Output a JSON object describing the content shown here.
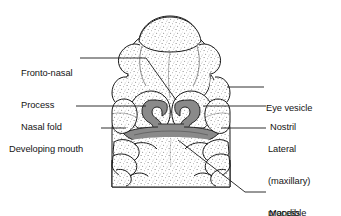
{
  "figure": {
    "type": "anatomical-line-diagram",
    "background_color": "#ffffff",
    "ink_color": "#141414",
    "stipple_color": "#7d7d7d",
    "shaded_region_color": "#8a8a8a",
    "shaded_region_outline": "#2a2a2a"
  },
  "labels": {
    "fronto_nasal_process": {
      "line1": "Fronto-nasal",
      "line2": "Process",
      "side": "left"
    },
    "nasal_fold": {
      "line1": "Nasal fold",
      "side": "left"
    },
    "developing_mouth": {
      "line1": "Developing mouth",
      "side": "left"
    },
    "eye_vesicle": {
      "line1": "Eye vesicle",
      "side": "right"
    },
    "nostril": {
      "line1": "Nostril",
      "side": "right"
    },
    "lateral_maxillary_process": {
      "line1": "Lateral",
      "line2": "(maxillary)",
      "line3": "process",
      "side": "right"
    },
    "mandible": {
      "line1": "Mandible",
      "side": "right"
    }
  },
  "structures": [
    {
      "name": "fronto-nasal-process",
      "description": "large multi-lobed stippled mass at top of face"
    },
    {
      "name": "eye-vesicle-left",
      "description": "small rounded bump on left lateral margin"
    },
    {
      "name": "eye-vesicle-right",
      "description": "small rounded bump on right lateral margin"
    },
    {
      "name": "nasal-fold-left",
      "description": "horseshoe ridge surrounding left nasal pit"
    },
    {
      "name": "nasal-fold-right",
      "description": "horseshoe ridge surrounding right nasal pit"
    },
    {
      "name": "nostril-left",
      "description": "dark hooked nasal pit, left"
    },
    {
      "name": "nostril-right",
      "description": "dark hooked nasal pit, right"
    },
    {
      "name": "developing-mouth",
      "description": "dark transverse stomodeum band below nasal pits"
    },
    {
      "name": "lateral-maxillary-process-left",
      "description": "stippled lobe lateral to mouth, left"
    },
    {
      "name": "lateral-maxillary-process-right",
      "description": "stippled lobe lateral to mouth, right"
    },
    {
      "name": "mandible",
      "description": "broad stippled mandibular arch below mouth with scalloped lateral lobes"
    }
  ],
  "caption": {
    "clipped_text": "             "
  }
}
